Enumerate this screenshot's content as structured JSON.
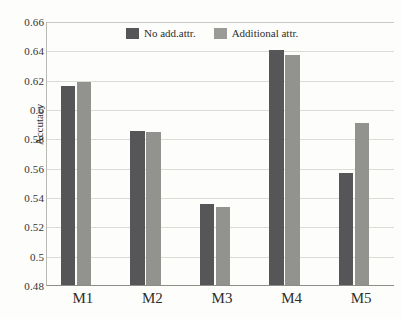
{
  "chart_data": {
    "type": "bar",
    "title": "",
    "xlabel": "",
    "ylabel": "Accutacy",
    "categories": [
      "M1",
      "M2",
      "M3",
      "M4",
      "M5"
    ],
    "series": [
      {
        "name": "No add.attr.",
        "color": "#565658",
        "values": [
          0.6155,
          0.5852,
          0.5355,
          0.6405,
          0.5561
        ]
      },
      {
        "name": "Additional attr.",
        "color": "#92928f",
        "values": [
          0.6183,
          0.584,
          0.5335,
          0.6365,
          0.5908
        ]
      }
    ],
    "ylim": [
      0.48,
      0.66
    ],
    "yticks": [
      "0.48",
      "0.5",
      "0.52",
      "0.54",
      "0.56",
      "0.58",
      "0.6",
      "0.62",
      "0.64",
      "0.66"
    ],
    "ytick_values": [
      0.48,
      0.5,
      0.52,
      0.54,
      0.56,
      0.58,
      0.6,
      0.62,
      0.64,
      0.66
    ],
    "grid": true,
    "legend_position": "top-center",
    "legend": [
      "No add.attr.",
      "Additional attr."
    ]
  }
}
